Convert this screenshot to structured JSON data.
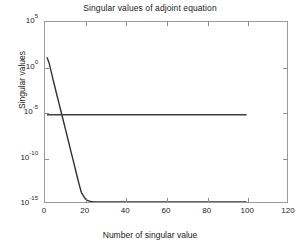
{
  "chart_data": {
    "type": "line",
    "title": "Singular values of adjoint equation",
    "xlabel": "Number of singular value",
    "ylabel": "Singular values",
    "yscale": "log",
    "xlim": [
      0,
      120
    ],
    "ylim": [
      1e-15,
      100000.0
    ],
    "grid": false,
    "legend": null,
    "xticks": [
      0,
      20,
      40,
      60,
      80,
      100,
      120
    ],
    "xticklabels": [
      "0",
      "20",
      "40",
      "60",
      "80",
      "100",
      "120"
    ],
    "yticks": [
      100000.0,
      1.0,
      1e-05,
      1e-10,
      1e-15
    ],
    "yticklabels": [
      {
        "mantissa": "10",
        "exponent": "5"
      },
      {
        "mantissa": "10",
        "exponent": "0"
      },
      {
        "mantissa": "10",
        "exponent": "-5"
      },
      {
        "mantissa": "10",
        "exponent": "-10"
      },
      {
        "mantissa": "10",
        "exponent": "-15"
      }
    ],
    "series": [
      {
        "name": "decaying singular values",
        "color": "#303030",
        "linewidth": 1.4,
        "x": [
          1,
          2,
          3,
          4,
          5,
          6,
          7,
          8,
          9,
          10,
          11,
          12,
          13,
          14,
          15,
          16,
          17,
          18,
          19,
          20,
          21,
          22,
          23,
          24,
          25,
          26,
          27,
          30,
          40,
          50,
          60,
          70,
          80,
          90,
          100
        ],
        "y": [
          12.0,
          3.0,
          0.35,
          0.04,
          0.005,
          0.0006,
          8e-05,
          1e-05,
          1.3e-06,
          1.6e-07,
          2e-08,
          2.5e-09,
          3e-10,
          4e-11,
          5e-12,
          6e-13,
          8e-14,
          1.2e-14,
          5e-15,
          2.2e-15,
          1.5e-15,
          1.25e-15,
          1.15e-15,
          1.08e-15,
          1.03e-15,
          1e-15,
          1e-15,
          1e-15,
          1e-15,
          1e-15,
          1e-15,
          1e-15,
          1e-15,
          1e-15,
          1e-15
        ]
      },
      {
        "name": "regularization floor",
        "color": "#404040",
        "linewidth": 1.4,
        "x": [
          1,
          10,
          20,
          30,
          40,
          50,
          60,
          70,
          80,
          90,
          100
        ],
        "y": [
          5e-06,
          5e-06,
          5e-06,
          5e-06,
          5e-06,
          5e-06,
          5e-06,
          5e-06,
          5e-06,
          5e-06,
          5e-06
        ]
      }
    ]
  },
  "axes": {
    "box_color": "#9a9a9a",
    "tick_color": "#8c8c8c"
  }
}
